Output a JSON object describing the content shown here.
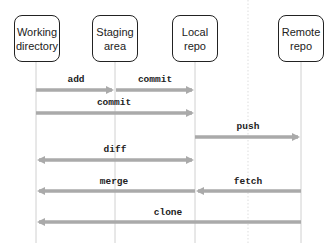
{
  "diagram": {
    "type": "sequence",
    "participants": [
      {
        "id": "working",
        "label": "Working directory",
        "line1": "Working",
        "line2": "directory",
        "x": 36
      },
      {
        "id": "staging",
        "label": "Staging area",
        "line1": "Staging",
        "line2": "area",
        "x": 115
      },
      {
        "id": "local",
        "label": "Local repo",
        "line1": "Local",
        "line2": "repo",
        "x": 195
      },
      {
        "id": "remote",
        "label": "Remote repo",
        "line1": "Remote",
        "line2": "repo",
        "x": 301
      }
    ],
    "messages": [
      {
        "label": "add",
        "from": "working",
        "to": "staging",
        "direction": "right"
      },
      {
        "label": "commit",
        "from": "staging",
        "to": "local",
        "direction": "right"
      },
      {
        "label": "commit",
        "from": "working",
        "to": "local",
        "direction": "right"
      },
      {
        "label": "push",
        "from": "local",
        "to": "remote",
        "direction": "right"
      },
      {
        "label": "diff",
        "from": "working",
        "to": "local",
        "direction": "both"
      },
      {
        "label": "merge",
        "from": "local",
        "to": "working",
        "direction": "left"
      },
      {
        "label": "fetch",
        "from": "remote",
        "to": "local",
        "direction": "left"
      },
      {
        "label": "clone",
        "from": "remote",
        "to": "working",
        "direction": "left"
      }
    ],
    "colors": {
      "arrow": "#aaaaaa",
      "lifeline": "#d0d0d0",
      "box_border": "#222222"
    }
  }
}
